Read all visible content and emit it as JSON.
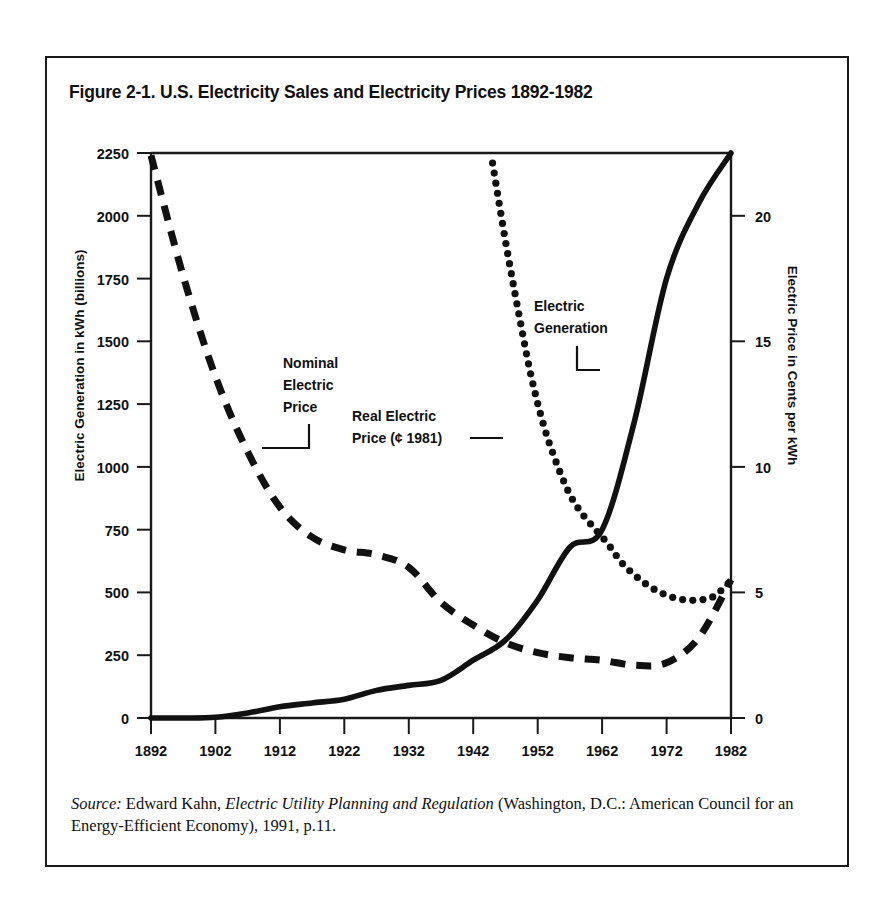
{
  "figure": {
    "title": "Figure 2-1. U.S. Electricity Sales and Electricity Prices 1892-1982",
    "source_label": "Source:",
    "source_author": "Edward Kahn,",
    "source_title": "Electric Utility Planning and Regulation",
    "source_rest": "(Washington, D.C.: American Council for an Energy-Efficient Economy), 1991, p.11."
  },
  "annotations": {
    "nominal_price": "Nominal\nElectric\nPrice",
    "nominal_price_l1": "Nominal",
    "nominal_price_l2": "Electric",
    "nominal_price_l3": "Price",
    "real_price_l1": "Real Electric",
    "real_price_l2": "Price (¢ 1981)",
    "generation_l1": "Electric",
    "generation_l2": "Generation"
  },
  "chart_data": {
    "type": "line",
    "title": "Figure 2-1. U.S. Electricity Sales and Electricity Prices 1892-1982",
    "xlabel": "",
    "ylabel": "Electric Generation in kWh (billions)",
    "y2label": "Electric Price in Cents per kWh",
    "xlim": [
      1892,
      1982
    ],
    "ylim": [
      0,
      2250
    ],
    "y2lim": [
      0,
      22.5
    ],
    "grid": false,
    "legend": "in-plot annotations",
    "xticks": [
      1892,
      1902,
      1912,
      1922,
      1932,
      1942,
      1952,
      1962,
      1972,
      1982
    ],
    "yticks": [
      0,
      250,
      500,
      750,
      1000,
      1250,
      1500,
      1750,
      2000,
      2250
    ],
    "y2ticks": [
      0,
      5,
      10,
      15,
      20
    ],
    "series": [
      {
        "name": "Electric Generation",
        "axis": "left",
        "style": "solid",
        "unit": "billion kWh",
        "x": [
          1892,
          1897,
          1902,
          1907,
          1912,
          1917,
          1922,
          1927,
          1932,
          1937,
          1942,
          1947,
          1952,
          1957,
          1962,
          1967,
          1972,
          1977,
          1982
        ],
        "values": [
          0,
          0,
          3,
          20,
          45,
          60,
          75,
          110,
          130,
          150,
          230,
          310,
          470,
          680,
          750,
          1180,
          1750,
          2050,
          2250
        ]
      },
      {
        "name": "Nominal Electric Price",
        "axis": "right",
        "style": "dashed",
        "unit": "cents per kWh",
        "x": [
          1892,
          1897,
          1902,
          1907,
          1912,
          1917,
          1922,
          1927,
          1932,
          1937,
          1942,
          1947,
          1952,
          1957,
          1962,
          1967,
          1972,
          1977,
          1982
        ],
        "values": [
          22.4,
          17.6,
          13.6,
          10.6,
          8.4,
          7.2,
          6.7,
          6.5,
          6.0,
          4.6,
          3.7,
          3.0,
          2.6,
          2.4,
          2.3,
          2.1,
          2.2,
          3.2,
          5.5
        ]
      },
      {
        "name": "Real Electric Price (¢ 1981)",
        "axis": "right",
        "style": "dotted",
        "unit": "1981 cents per kWh",
        "x": [
          1945,
          1947,
          1949,
          1951,
          1953,
          1955,
          1957,
          1959,
          1961,
          1963,
          1965,
          1967,
          1969,
          1971,
          1973,
          1975,
          1977,
          1979,
          1981,
          1982
        ],
        "values": [
          22.1,
          19.0,
          16.2,
          13.6,
          11.6,
          10.1,
          8.9,
          8.1,
          7.5,
          6.9,
          6.2,
          5.7,
          5.3,
          5.0,
          4.8,
          4.7,
          4.7,
          4.8,
          5.2,
          5.5
        ]
      }
    ],
    "annotations": [
      {
        "text": "Nominal Electric Price",
        "target_series": "Nominal Electric Price",
        "at_year": 1915
      },
      {
        "text": "Real Electric Price (¢ 1981)",
        "target_series": "Real Electric Price (¢ 1981)",
        "at_year": 1953
      },
      {
        "text": "Electric Generation",
        "target_series": "Electric Generation",
        "at_year": 1968
      }
    ]
  }
}
